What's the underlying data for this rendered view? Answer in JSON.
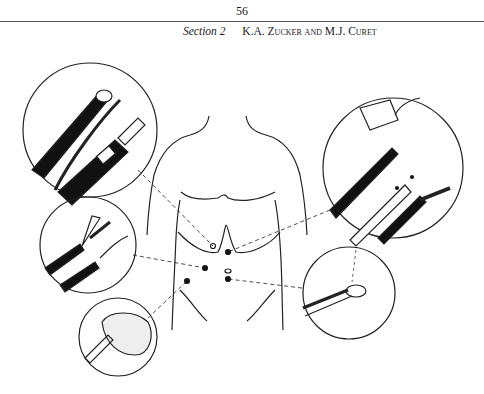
{
  "page": {
    "number": "56",
    "running_head": {
      "section": "Section 2",
      "authors": "K.A. Zucker and M.J. Curet"
    }
  },
  "figure": {
    "callouts": [
      {
        "name": "laparoscope-endoscope",
        "position": "top-left"
      },
      {
        "name": "graspers-clip-applier",
        "position": "top-right"
      },
      {
        "name": "dissecting-forceps",
        "position": "middle-left"
      },
      {
        "name": "trocar-cannula",
        "position": "middle-right"
      },
      {
        "name": "specimen-retrieval-bag",
        "position": "bottom-left"
      }
    ],
    "port_sites": 5
  }
}
